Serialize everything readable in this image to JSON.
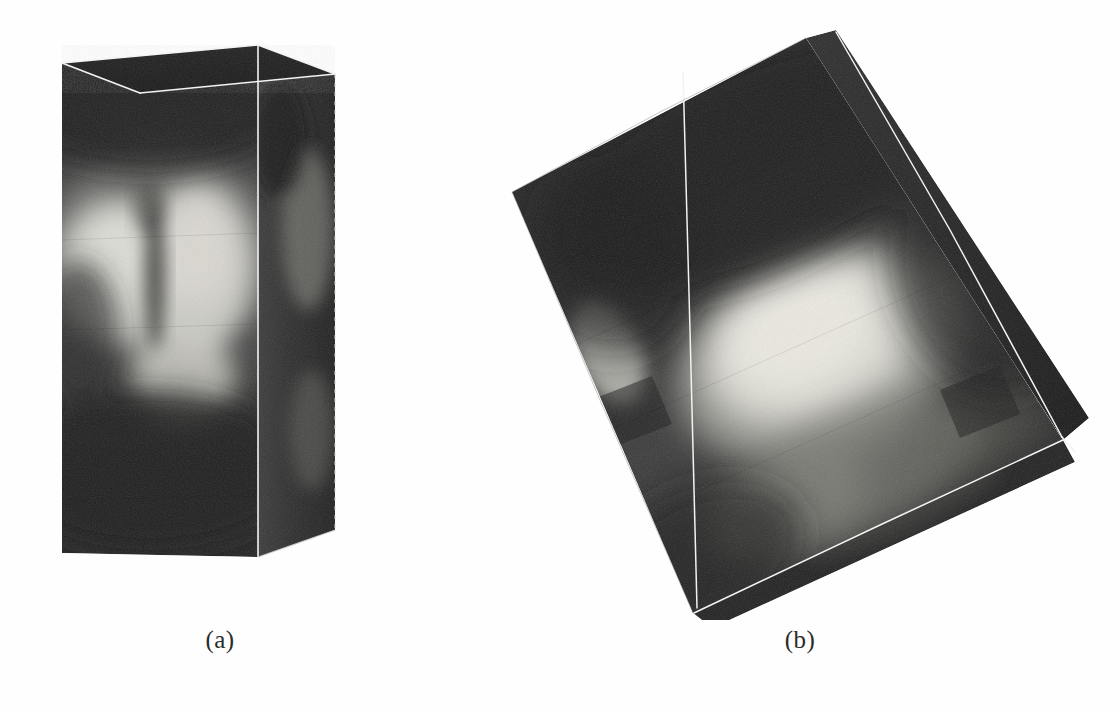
{
  "figure": {
    "kind": "scanned-scientific-figure",
    "background_color": "#fefefe",
    "panels": [
      {
        "id": "a",
        "caption": "(a)",
        "description": "Axis-aligned 3D volume rendering of an ultrasound data block shown as an upright rectangular box with white wireframe edges",
        "view": "front, un-rotated",
        "box_pixels": {
          "left": 62,
          "top": 45,
          "right": 335,
          "bottom": 557
        },
        "wireframe_color": "#f2f2f2",
        "dark_color": "#2a2a2a",
        "mid_color": "#6d6d6d",
        "bright_color": "#d8d8d2",
        "features": [
          {
            "name": "left-bright-lobe",
            "cx": 118,
            "cy": 272,
            "rx": 62,
            "ry": 72,
            "intensity": "bright"
          },
          {
            "name": "right-bright-lobe",
            "cx": 196,
            "cy": 268,
            "rx": 58,
            "ry": 86,
            "intensity": "bright"
          },
          {
            "name": "lower-bright-lobe",
            "cx": 183,
            "cy": 378,
            "rx": 52,
            "ry": 48,
            "intensity": "bright"
          },
          {
            "name": "central-dark-groove",
            "cx": 152,
            "cy": 290,
            "rx": 12,
            "ry": 76,
            "intensity": "dark"
          }
        ]
      },
      {
        "id": "b",
        "caption": "(b)",
        "description": "Same volume after an oblique rotation, shown as a tilted quadrilateral with white wireframe edges",
        "view": "rotated / oblique",
        "vertices_pixels": {
          "top": [
            806,
            38
          ],
          "left": [
            512,
            192
          ],
          "bottom_left": [
            693,
            613
          ],
          "right": [
            1063,
            440
          ]
        },
        "wireframe_color": "#f2f2f2",
        "dark_color": "#262626",
        "mid_color": "#6a6a6a",
        "bright_color": "#e2e2dc",
        "features": [
          {
            "name": "main-bright-blob",
            "cx": 810,
            "cy": 345,
            "rx": 130,
            "ry": 92,
            "intensity": "bright"
          },
          {
            "name": "left-bright-patch",
            "cx": 612,
            "cy": 350,
            "rx": 34,
            "ry": 58,
            "intensity": "bright"
          },
          {
            "name": "lower-mid-band",
            "cx": 830,
            "cy": 470,
            "rx": 140,
            "ry": 60,
            "intensity": "mid"
          },
          {
            "name": "upper-dark-region",
            "cx": 760,
            "cy": 170,
            "rx": 200,
            "ry": 90,
            "intensity": "dark"
          }
        ]
      }
    ]
  }
}
